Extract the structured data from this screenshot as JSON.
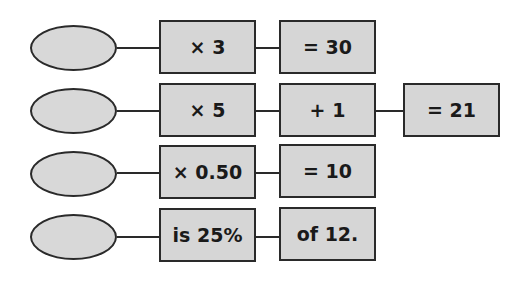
{
  "rows": [
    {
      "ops": [
        "× 3",
        "= 30"
      ]
    },
    {
      "ops": [
        "× 5",
        "+ 1",
        "= 21"
      ]
    },
    {
      "ops": [
        "× 0.50",
        "= 10"
      ]
    },
    {
      "ops": [
        "is 25%",
        "of 12."
      ]
    }
  ],
  "colors": {
    "box_fill": "#d6d6d6",
    "stroke": "#2a2a2a"
  }
}
